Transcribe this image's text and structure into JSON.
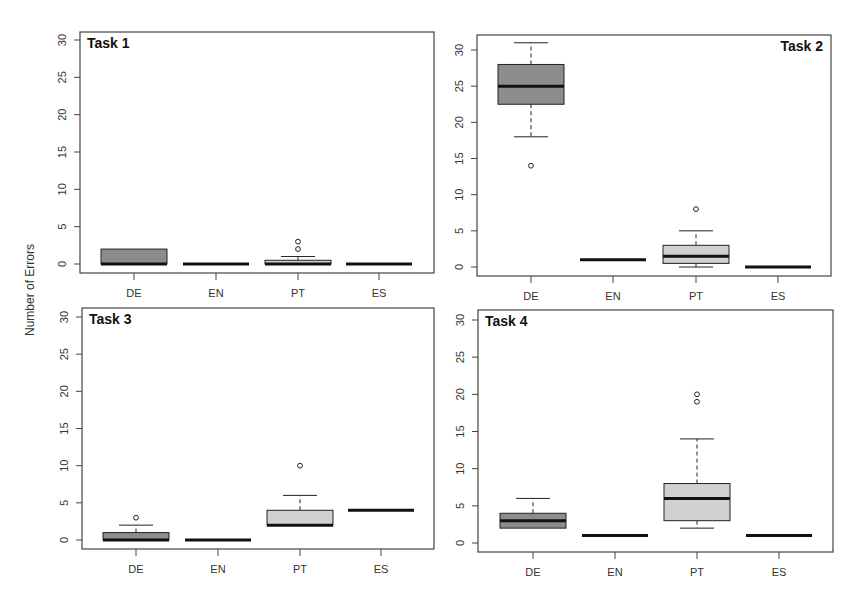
{
  "figure": {
    "ylabel": "Number of Errors",
    "colors": {
      "dark_box": "#8c8c8c",
      "light_box": "#d0d0d0",
      "line": "#222222",
      "frame": "#444444"
    }
  },
  "chart_data": [
    {
      "type": "box",
      "title": "Task 1",
      "title_position": "top-left",
      "categories": [
        "DE",
        "EN",
        "PT",
        "ES"
      ],
      "ylabel": "Number of Errors",
      "ylim": [
        0,
        30
      ],
      "yticks": [
        0,
        5,
        10,
        15,
        20,
        25,
        30
      ],
      "boxes": [
        {
          "label": "DE",
          "fill": "dark",
          "whisker_low": 0,
          "q1": 0,
          "median": 0,
          "q3": 2,
          "whisker_high": 2,
          "outliers": []
        },
        {
          "label": "EN",
          "fill": "dark",
          "whisker_low": 0,
          "q1": 0,
          "median": 0,
          "q3": 0,
          "whisker_high": 0,
          "outliers": []
        },
        {
          "label": "PT",
          "fill": "light",
          "whisker_low": 0,
          "q1": 0,
          "median": 0,
          "q3": 0.5,
          "whisker_high": 1,
          "outliers": [
            2,
            3
          ]
        },
        {
          "label": "ES",
          "fill": "light",
          "whisker_low": 0,
          "q1": 0,
          "median": 0,
          "q3": 0,
          "whisker_high": 0,
          "outliers": []
        }
      ]
    },
    {
      "type": "box",
      "title": "Task 2",
      "title_position": "top-right",
      "categories": [
        "DE",
        "EN",
        "PT",
        "ES"
      ],
      "ylim": [
        0,
        30
      ],
      "yticks": [
        0,
        5,
        10,
        15,
        20,
        25,
        30
      ],
      "boxes": [
        {
          "label": "DE",
          "fill": "dark",
          "whisker_low": 18,
          "q1": 22.5,
          "median": 25,
          "q3": 28,
          "whisker_high": 31,
          "outliers": [
            14
          ]
        },
        {
          "label": "EN",
          "fill": "dark",
          "whisker_low": 1,
          "q1": 1,
          "median": 1,
          "q3": 1,
          "whisker_high": 1,
          "outliers": []
        },
        {
          "label": "PT",
          "fill": "light",
          "whisker_low": 0,
          "q1": 0.5,
          "median": 1.5,
          "q3": 3,
          "whisker_high": 5,
          "outliers": [
            8
          ]
        },
        {
          "label": "ES",
          "fill": "light",
          "whisker_low": 0,
          "q1": 0,
          "median": 0,
          "q3": 0,
          "whisker_high": 0,
          "outliers": []
        }
      ]
    },
    {
      "type": "box",
      "title": "Task 3",
      "title_position": "top-left",
      "categories": [
        "DE",
        "EN",
        "PT",
        "ES"
      ],
      "ylim": [
        0,
        30
      ],
      "yticks": [
        0,
        5,
        10,
        15,
        20,
        25,
        30
      ],
      "boxes": [
        {
          "label": "DE",
          "fill": "dark",
          "whisker_low": 0,
          "q1": 0,
          "median": 0,
          "q3": 1,
          "whisker_high": 2,
          "outliers": [
            3
          ]
        },
        {
          "label": "EN",
          "fill": "dark",
          "whisker_low": 0,
          "q1": 0,
          "median": 0,
          "q3": 0,
          "whisker_high": 0,
          "outliers": []
        },
        {
          "label": "PT",
          "fill": "light",
          "whisker_low": 2,
          "q1": 2,
          "median": 2,
          "q3": 4,
          "whisker_high": 6,
          "outliers": [
            10
          ]
        },
        {
          "label": "ES",
          "fill": "light",
          "whisker_low": 4,
          "q1": 4,
          "median": 4,
          "q3": 4,
          "whisker_high": 4,
          "outliers": []
        }
      ]
    },
    {
      "type": "box",
      "title": "Task 4",
      "title_position": "top-left",
      "categories": [
        "DE",
        "EN",
        "PT",
        "ES"
      ],
      "ylim": [
        0,
        30
      ],
      "yticks": [
        0,
        5,
        10,
        15,
        20,
        25,
        30
      ],
      "boxes": [
        {
          "label": "DE",
          "fill": "dark",
          "whisker_low": 2,
          "q1": 2,
          "median": 3,
          "q3": 4,
          "whisker_high": 6,
          "outliers": []
        },
        {
          "label": "EN",
          "fill": "dark",
          "whisker_low": 1,
          "q1": 1,
          "median": 1,
          "q3": 1,
          "whisker_high": 1,
          "outliers": []
        },
        {
          "label": "PT",
          "fill": "light",
          "whisker_low": 2,
          "q1": 3,
          "median": 6,
          "q3": 8,
          "whisker_high": 14,
          "outliers": [
            19,
            20
          ]
        },
        {
          "label": "ES",
          "fill": "light",
          "whisker_low": 1,
          "q1": 1,
          "median": 1,
          "q3": 1,
          "whisker_high": 1,
          "outliers": []
        }
      ]
    }
  ]
}
